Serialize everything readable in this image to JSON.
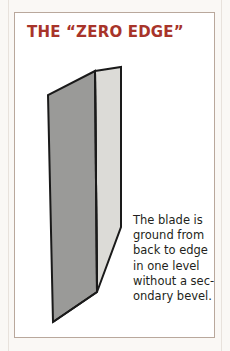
{
  "page": {
    "background_color": "#faf8f5"
  },
  "card": {
    "title": "THE “ZERO EDGE”",
    "title_color": "#a8342a",
    "border_color": "#b9a89c",
    "background_color": "#ffffff"
  },
  "illustration": {
    "name": "zero-edge-blade-diagram",
    "description": "Knife blade shown in three-quarter perspective with a single full-height grind",
    "outline_color": "#1a1a1a",
    "grind_face_color": "#9a9a98",
    "flat_face_color": "#dcdbd7",
    "faces": [
      {
        "name": "grind-face",
        "label": "ground bevel face",
        "fill": "#9a9a98"
      },
      {
        "name": "flat-face",
        "label": "flat side face",
        "fill": "#dcdbd7"
      }
    ]
  },
  "caption": {
    "full_text": "The blade is ground from back to edge in one level without a secondary bevel.",
    "lines": [
      "The blade is",
      "ground from",
      "back to edge",
      "in one level",
      "without a sec-",
      "ondary bevel."
    ],
    "text_color": "#231f20"
  }
}
